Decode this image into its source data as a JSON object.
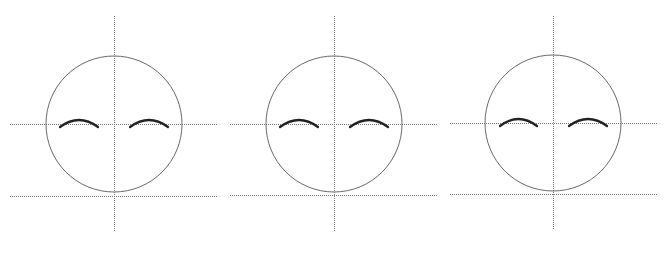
{
  "diagram": {
    "type": "face-proportion-guides",
    "background": "#ffffff",
    "colors": {
      "guide_line": "#7a7a7a",
      "head_outline": "#6a6a6a",
      "eyebrow": "#222222"
    },
    "faces": [
      {
        "id": "face-1",
        "head": {
          "cx": 114,
          "cy": 124,
          "r": 68
        },
        "vertical_guide": {
          "x": 114,
          "y1": 16,
          "y2": 232
        },
        "horizontal_guides": [
          {
            "name": "eye-line",
            "y": 124,
            "x1": 10,
            "x2": 218
          },
          {
            "name": "chin-line",
            "y": 196,
            "x1": 10,
            "x2": 218
          }
        ],
        "eyebrows": [
          {
            "side": "left",
            "x1": 60,
            "x2": 98,
            "y_end": 127,
            "y_peak": 120
          },
          {
            "side": "right",
            "x1": 130,
            "x2": 168,
            "y_end": 127,
            "y_peak": 120
          }
        ]
      },
      {
        "id": "face-2",
        "head": {
          "cx": 334,
          "cy": 124,
          "r": 68
        },
        "vertical_guide": {
          "x": 334,
          "y1": 16,
          "y2": 231
        },
        "horizontal_guides": [
          {
            "name": "eye-line",
            "y": 124,
            "x1": 230,
            "x2": 438
          },
          {
            "name": "chin-line",
            "y": 195,
            "x1": 230,
            "x2": 438
          }
        ],
        "eyebrows": [
          {
            "side": "left",
            "x1": 280,
            "x2": 318,
            "y_end": 127,
            "y_peak": 120
          },
          {
            "side": "right",
            "x1": 350,
            "x2": 388,
            "y_end": 127,
            "y_peak": 120
          }
        ]
      },
      {
        "id": "face-3",
        "head": {
          "cx": 553,
          "cy": 123,
          "r": 68
        },
        "vertical_guide": {
          "x": 553,
          "y1": 16,
          "y2": 230
        },
        "horizontal_guides": [
          {
            "name": "eye-line",
            "y": 123,
            "x1": 450,
            "x2": 657
          },
          {
            "name": "chin-line",
            "y": 194,
            "x1": 450,
            "x2": 657
          }
        ],
        "eyebrows": [
          {
            "side": "left",
            "x1": 500,
            "x2": 537,
            "y_end": 126,
            "y_peak": 119
          },
          {
            "side": "right",
            "x1": 569,
            "x2": 607,
            "y_end": 126,
            "y_peak": 119
          }
        ]
      }
    ]
  }
}
